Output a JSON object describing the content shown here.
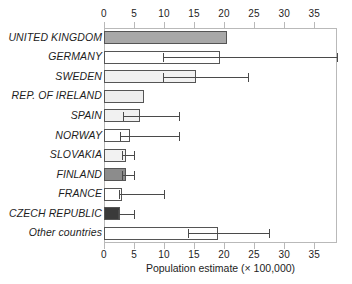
{
  "chart_data": {
    "type": "bar",
    "orientation": "horizontal",
    "title": "",
    "xlabel": "Population estimate (× 100,000)",
    "ylabel": "",
    "xlim": [
      0,
      38.8
    ],
    "xticks": [
      0,
      5,
      10,
      15,
      20,
      25,
      30,
      35
    ],
    "xticklabels": [
      "0",
      "5",
      "10",
      "15",
      "20",
      "25",
      "30",
      "35"
    ],
    "grid": false,
    "legend": null,
    "axis_top": true,
    "axis_bottom": true,
    "categories": [
      "UNITED KINGDOM",
      "GERMANY",
      "SWEDEN",
      "REP. OF IRELAND",
      "SPAIN",
      "NORWAY",
      "SLOVAKIA",
      "FINLAND",
      "FRANCE",
      "CZECH REPUBLIC",
      "Other countries"
    ],
    "values": [
      20.5,
      19.3,
      15.3,
      6.7,
      6.0,
      4.3,
      3.7,
      3.7,
      3.0,
      2.7,
      19.0
    ],
    "error_low": [
      null,
      9.8,
      9.8,
      null,
      3.2,
      2.7,
      3.0,
      3.0,
      2.5,
      2.3,
      14.0
    ],
    "error_high": [
      null,
      38.8,
      24.0,
      null,
      12.5,
      12.5,
      5.0,
      5.0,
      10.0,
      5.0,
      27.5
    ],
    "fill_shades": [
      "#a8a8a8",
      "#ffffff",
      "#f1f1f1",
      "#eeeeee",
      "#f1f1f1",
      "#ffffff",
      "#f2f2f2",
      "#8c8c8c",
      "#ffffff",
      "#3a3a3a",
      "#ffffff"
    ],
    "bar_edge_color": "#555555",
    "error_color": "#4a4a4a",
    "frame_color": "#b9b9b9"
  }
}
